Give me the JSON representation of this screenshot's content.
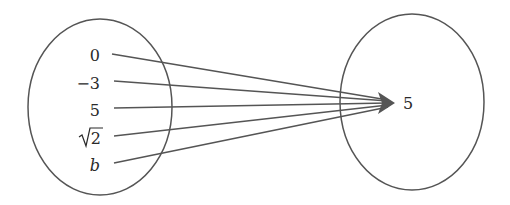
{
  "diagram": {
    "type": "function-mapping",
    "domain_set": {
      "name": "domain-set",
      "elements": [
        {
          "label": "0",
          "y": 55
        },
        {
          "label": "−3",
          "y": 83
        },
        {
          "label": "5",
          "y": 110
        },
        {
          "label": "2",
          "radical": true,
          "y": 137
        },
        {
          "label": "b",
          "italic": true,
          "y": 165
        }
      ]
    },
    "codomain_set": {
      "name": "codomain-set",
      "elements": [
        {
          "label": "5"
        }
      ]
    },
    "mappings": [
      {
        "from": "0",
        "to": "5"
      },
      {
        "from": "−3",
        "to": "5"
      },
      {
        "from": "5",
        "to": "5"
      },
      {
        "from": "√2",
        "to": "5"
      },
      {
        "from": "b",
        "to": "5"
      }
    ],
    "colors": {
      "stroke": "#555555",
      "text": "#2a2a2a",
      "background": "#ffffff"
    }
  }
}
